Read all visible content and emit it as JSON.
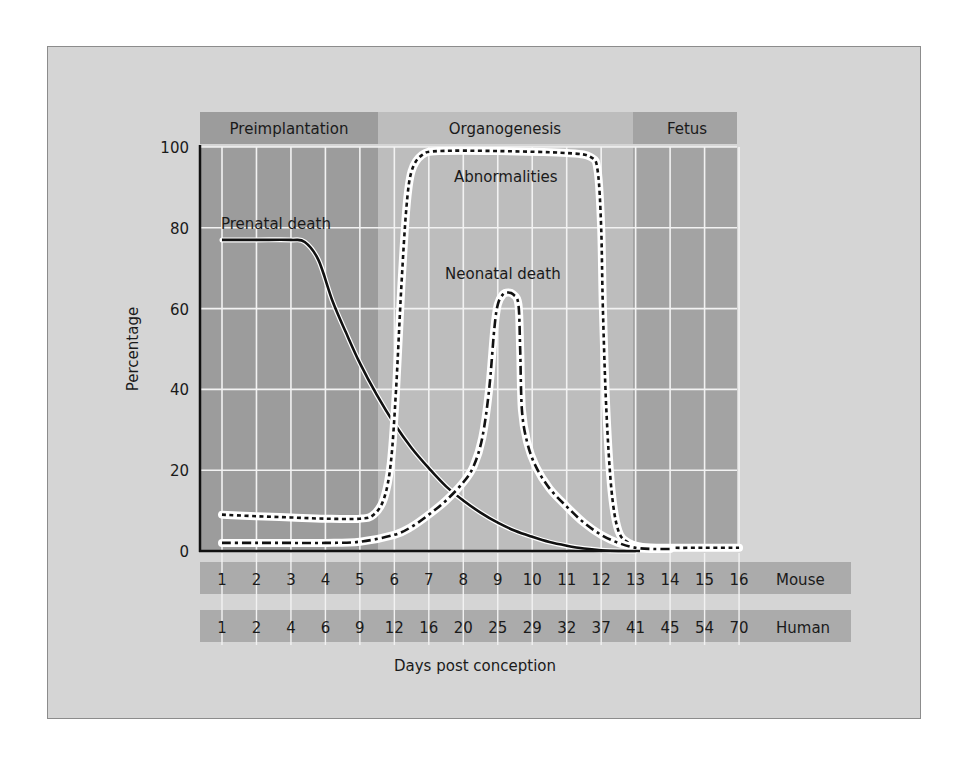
{
  "chart_data": {
    "type": "line",
    "title": "",
    "xlabel": "Days post conception",
    "ylabel": "Percentage",
    "ylim": [
      0,
      100
    ],
    "yticks": [
      0,
      20,
      40,
      60,
      80,
      100
    ],
    "grid": true,
    "x_mouse_days": [
      1,
      2,
      3,
      4,
      5,
      6,
      7,
      8,
      9,
      10,
      11,
      12,
      13,
      14,
      15,
      16
    ],
    "x_human_days": [
      1,
      2,
      4,
      6,
      9,
      12,
      16,
      20,
      25,
      29,
      32,
      37,
      41,
      45,
      54,
      70
    ],
    "x_row_labels": {
      "mouse": "Mouse",
      "human": "Human"
    },
    "stages": [
      {
        "name": "Preimplantation",
        "from_mouse_day": 0.4,
        "to_mouse_day": 5.6,
        "shade": "#9c9c9c"
      },
      {
        "name": "Organogenesis",
        "from_mouse_day": 5.6,
        "to_mouse_day": 12.2,
        "shade": "#bdbdbd"
      },
      {
        "name": "Fetus",
        "from_mouse_day": 12.2,
        "to_mouse_day": 15.2,
        "shade": "#a3a3a3"
      }
    ],
    "series": [
      {
        "name": "Prenatal death",
        "style": "solid",
        "points": [
          [
            1,
            77
          ],
          [
            2,
            77
          ],
          [
            3,
            77
          ],
          [
            3.4,
            76.5
          ],
          [
            3.8,
            72
          ],
          [
            4.2,
            62
          ],
          [
            4.6,
            54
          ],
          [
            5,
            46.5
          ],
          [
            5.5,
            38.5
          ],
          [
            6,
            31.5
          ],
          [
            6.5,
            25.5
          ],
          [
            7,
            20.5
          ],
          [
            7.5,
            16
          ],
          [
            8,
            12.5
          ],
          [
            8.5,
            9.5
          ],
          [
            9,
            7
          ],
          [
            9.5,
            5
          ],
          [
            10,
            3.5
          ],
          [
            10.5,
            2.2
          ],
          [
            11,
            1.3
          ],
          [
            11.5,
            0.6
          ],
          [
            12,
            0.2
          ],
          [
            12.5,
            0
          ],
          [
            13,
            0
          ]
        ]
      },
      {
        "name": "Abnormalities",
        "style": "dotted",
        "points": [
          [
            1,
            9
          ],
          [
            2,
            8.6
          ],
          [
            3,
            8.3
          ],
          [
            4,
            8
          ],
          [
            5,
            8
          ],
          [
            5.4,
            9
          ],
          [
            5.7,
            13
          ],
          [
            5.9,
            22
          ],
          [
            6.05,
            40
          ],
          [
            6.2,
            65
          ],
          [
            6.35,
            85
          ],
          [
            6.5,
            94
          ],
          [
            6.8,
            98
          ],
          [
            7.3,
            99
          ],
          [
            9,
            99
          ],
          [
            11,
            98.5
          ],
          [
            11.7,
            97.5
          ],
          [
            11.9,
            94
          ],
          [
            12,
            80
          ],
          [
            12.05,
            60
          ],
          [
            12.15,
            35
          ],
          [
            12.3,
            15
          ],
          [
            12.5,
            5
          ],
          [
            12.8,
            2
          ],
          [
            13.2,
            1
          ],
          [
            14,
            0.8
          ],
          [
            15,
            0.8
          ],
          [
            16,
            0.8
          ]
        ]
      },
      {
        "name": "Neonatal death",
        "style": "dash-dot",
        "points": [
          [
            1,
            2
          ],
          [
            2,
            2
          ],
          [
            3,
            2
          ],
          [
            4,
            2
          ],
          [
            5,
            2.3
          ],
          [
            6,
            4
          ],
          [
            6.5,
            6
          ],
          [
            7,
            9
          ],
          [
            7.5,
            12.5
          ],
          [
            8,
            17
          ],
          [
            8.3,
            21
          ],
          [
            8.55,
            28
          ],
          [
            8.75,
            40
          ],
          [
            8.9,
            55
          ],
          [
            9.0,
            61
          ],
          [
            9.15,
            63.5
          ],
          [
            9.3,
            64
          ],
          [
            9.45,
            63.5
          ],
          [
            9.6,
            61
          ],
          [
            9.65,
            50
          ],
          [
            9.7,
            35
          ],
          [
            9.85,
            27
          ],
          [
            10.1,
            21
          ],
          [
            10.5,
            15.5
          ],
          [
            11,
            11
          ],
          [
            11.5,
            7
          ],
          [
            12,
            4
          ],
          [
            12.5,
            2
          ],
          [
            13,
            0.8
          ],
          [
            13.5,
            0.5
          ],
          [
            14,
            0.5
          ]
        ]
      }
    ],
    "annotations": [
      {
        "text": "Prenatal death",
        "near_mouse_day": 1,
        "near_pct": 80
      },
      {
        "text": "Abnormalities",
        "near_mouse_day": 8.3,
        "near_pct": 92.5
      },
      {
        "text": "Neonatal death",
        "near_mouse_day": 8.8,
        "near_pct": 68
      }
    ]
  },
  "labels": {
    "stage_preimplantation": "Preimplantation",
    "stage_organogenesis": "Organogenesis",
    "stage_fetus": "Fetus",
    "ylabel": "Percentage",
    "xlabel": "Days post conception",
    "mouse": "Mouse",
    "human": "Human",
    "curve_prenatal": "Prenatal death",
    "curve_abnormalities": "Abnormalities",
    "curve_neonatal": "Neonatal death"
  }
}
